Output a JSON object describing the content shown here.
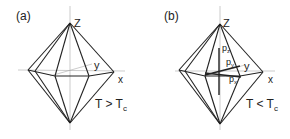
{
  "panels": [
    {
      "label": "(a)",
      "z": "Z",
      "x": "x",
      "y": "y",
      "condition_main": "T > T",
      "condition_sub": "c"
    },
    {
      "label": "(b)",
      "z": "Z",
      "x": "x",
      "y": "y",
      "condition_main": "T < T",
      "condition_sub": "c",
      "vectors": {
        "pz": "p",
        "pz_sub": "z",
        "py": "p",
        "py_sub": "y",
        "px": "p",
        "px_sub": "x"
      }
    }
  ]
}
